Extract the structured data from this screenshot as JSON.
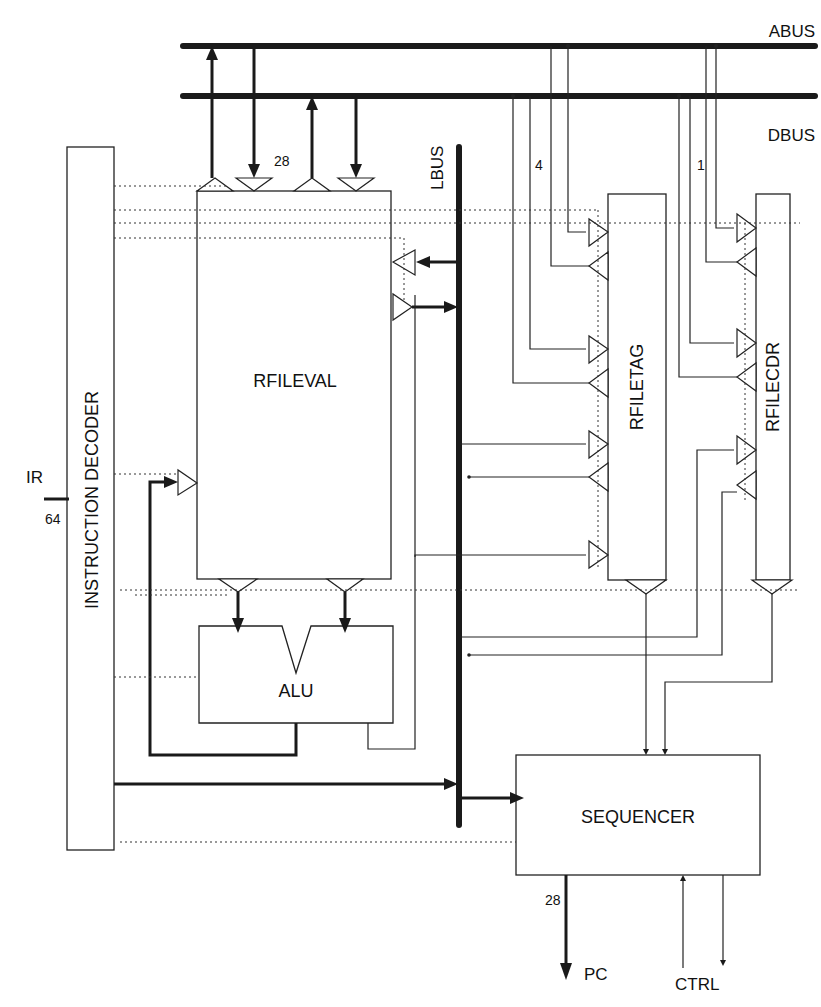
{
  "diagram": {
    "buses": {
      "abus": "ABUS",
      "dbus": "DBUS",
      "lbus": "LBUS"
    },
    "blocks": {
      "instruction_decoder": "INSTRUCTION DECODER",
      "rfileval": "RFILEVAL",
      "alu": "ALU",
      "rfiletag": "RFILETAG",
      "rfilecdr": "RFILECDR",
      "sequencer": "SEQUENCER"
    },
    "signals": {
      "ir": "IR",
      "ir_width": "64",
      "rfileval_bus_width": "28",
      "rfiletag_width": "4",
      "rfilecdr_width": "1",
      "pc": "PC",
      "pc_width": "28",
      "ctrl": "CTRL"
    },
    "colors": {
      "line": "#1a1a1a",
      "background": "#ffffff"
    }
  }
}
